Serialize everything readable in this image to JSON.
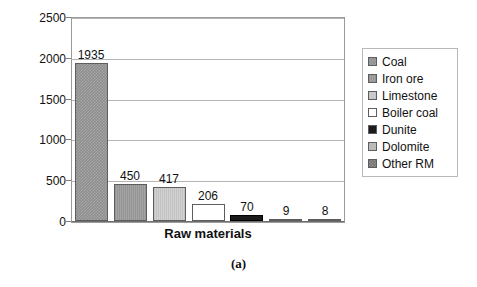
{
  "chart_data": {
    "type": "bar",
    "title": "",
    "xlabel": "Raw materials",
    "ylabel": "Rs. per tonne",
    "ylabel_rendered": "Rs. per tonn",
    "caption": "(a)",
    "categories": [
      "Coal",
      "Iron ore",
      "Limestone",
      "Boiler coal",
      "Dunite",
      "Dolomite",
      "Other RM"
    ],
    "values": [
      1935,
      450,
      417,
      206,
      70,
      9,
      8
    ],
    "value_labels": [
      "1935",
      "450",
      "417",
      "206",
      "70",
      "9",
      "8"
    ],
    "ylim": [
      0,
      2500
    ],
    "yticks": [
      0,
      500,
      1000,
      1500,
      2000,
      2500
    ],
    "ytick_labels": [
      "0",
      "500",
      "1000",
      "1500",
      "2000",
      "2500"
    ],
    "grid": true,
    "legend_position": "right",
    "series_colors": [
      "#8d8d8d",
      "#9b9b9b",
      "#c9c9c9",
      "#ffffff",
      "#1b1b1b",
      "#b3b3b3",
      "#767676"
    ],
    "legend": [
      {
        "label": "Coal",
        "swatch": "coal-swatch",
        "fill": "f-coal"
      },
      {
        "label": "Iron ore",
        "swatch": "iron-ore-swatch",
        "fill": "f-iron"
      },
      {
        "label": "Limestone",
        "swatch": "limestone-swatch",
        "fill": "f-lime"
      },
      {
        "label": "Boiler coal",
        "swatch": "boiler-coal-swatch",
        "fill": "f-boiler"
      },
      {
        "label": "Dunite",
        "swatch": "dunite-swatch",
        "fill": "f-dunite"
      },
      {
        "label": "Dolomite",
        "swatch": "dolomite-swatch",
        "fill": "f-dolomite"
      },
      {
        "label": "Other RM",
        "swatch": "other-rm-swatch",
        "fill": "f-other"
      }
    ]
  }
}
